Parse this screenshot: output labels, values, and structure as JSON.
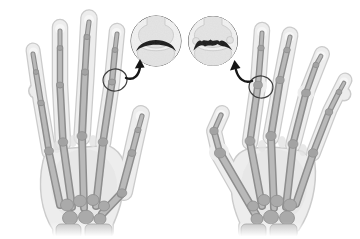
{
  "figure": {
    "kind": "medical-xray-illustration",
    "left_hand": "hand-with-straight-fingers",
    "right_hand": "hand-with-crooked-deformed-fingers-and-bent-thumb",
    "left_inset": "magnified-finger-joint-smooth-joint-space",
    "right_inset": "magnified-finger-joint-irregular-narrowed-joint-space",
    "left_marker": "circle-on-left-hand-index-finger-joint",
    "right_marker": "circle-on-right-hand-index-finger-joint"
  },
  "colors": {
    "background": "#ffffff",
    "hand_fill": "#ededed",
    "hand_edge": "#cbcbcb",
    "hand_shade": "#e2e2e2",
    "tip_pad": "#f6f6f6",
    "bone_light": "#b9b9b9",
    "bone_dark": "#8d8d8d",
    "bone_joint": "#a3a3a3",
    "carpal_fill": "#aaaaaa",
    "forearm_bone": "#c4c4c4",
    "inset_bg": "#f3f3f3",
    "inset_bone": "#e5e5e5",
    "inset_bone_edge": "#c6c6c6",
    "joint_space": "#1a1a1a",
    "inset_ring": "#4f4f4f",
    "marker_ring": "#3c3c3c",
    "arrow": "#161616"
  }
}
